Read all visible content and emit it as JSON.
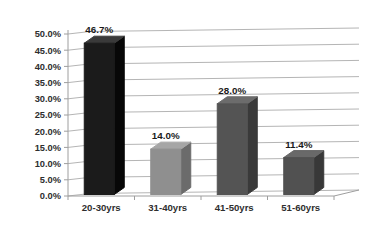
{
  "chart_data": {
    "type": "bar",
    "style": "3d-column",
    "title": "",
    "xlabel": "",
    "ylabel": "",
    "categories": [
      "20-30yrs",
      "31-40yrs",
      "41-50yrs",
      "51-60yrs"
    ],
    "values": [
      46.7,
      14.0,
      28.0,
      11.4
    ],
    "data_labels": [
      "46.7%",
      "14.0%",
      "28.0%",
      "11.4%"
    ],
    "ylim": [
      0,
      50
    ],
    "ytick_step": 5,
    "ytick_labels": [
      "0.0%",
      "5.0%",
      "10.0%",
      "15.0%",
      "20.0%",
      "25.0%",
      "30.0%",
      "35.0%",
      "40.0%",
      "45.0%",
      "50.0%"
    ],
    "grid": true,
    "legend": "none",
    "colors": {
      "bars": [
        {
          "front": "#1b1b1b",
          "side": "#070707",
          "top": "#3a3a3a"
        },
        {
          "front": "#8f8f8f",
          "side": "#6b6b6b",
          "top": "#a6a6a6"
        },
        {
          "front": "#545454",
          "side": "#3a3a3a",
          "top": "#6c6c6c"
        },
        {
          "front": "#515151",
          "side": "#383838",
          "top": "#696969"
        }
      ],
      "gridline": "#b5b5b5",
      "axis": "#9e9e9e",
      "text": "#2e2e2e",
      "background": "#ffffff"
    }
  }
}
